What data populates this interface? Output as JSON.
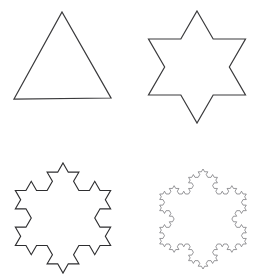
{
  "figure": {
    "background_color": "#ffffff",
    "width": 259,
    "height": 280,
    "layout": "2x2-grid",
    "panels": [
      {
        "name": "stage-0-triangle",
        "label": "Equilateral Triangle",
        "iteration": 0,
        "segment_count": 3,
        "cell": {
          "x": 0,
          "y": 0,
          "width": 130,
          "height": 140
        },
        "center_x": 62,
        "center_y": 70,
        "radius": 51,
        "rotation_deg": -90,
        "stroke_color": "#3a3a3c",
        "stroke_width": 1.25,
        "vertices": [
          {
            "x": 62,
            "y": 12
          },
          {
            "x": 111,
            "y": 98
          },
          {
            "x": 14,
            "y": 99
          }
        ]
      },
      {
        "name": "stage-1-hexagram",
        "label": "Star of David",
        "iteration": 1,
        "segment_count": 12,
        "cell": {
          "x": 130,
          "y": 0,
          "width": 129,
          "height": 140
        },
        "center_x": 197,
        "center_y": 67,
        "radius": 56,
        "rotation_deg": -90,
        "stroke_color": "#3a3a3c",
        "stroke_width": 1.2,
        "extent": {
          "top": 10,
          "bottom": 123,
          "left": 152,
          "right": 243
        }
      },
      {
        "name": "stage-2-snowflake",
        "label": "Koch Snowflake Iteration 2",
        "iteration": 2,
        "segment_count": 48,
        "cell": {
          "x": 0,
          "y": 140,
          "width": 130,
          "height": 140
        },
        "center_x": 63,
        "center_y": 218,
        "radius": 55,
        "rotation_deg": -90,
        "stroke_color": "#2e2e30",
        "stroke_width": 1.15,
        "extent": {
          "top": 163,
          "bottom": 273,
          "left": 11,
          "right": 115
        }
      },
      {
        "name": "stage-3-snowflake",
        "label": "Koch Snowflake Iteration 3",
        "iteration": 3,
        "segment_count": 192,
        "cell": {
          "x": 130,
          "y": 140,
          "width": 129,
          "height": 140
        },
        "center_x": 203,
        "center_y": 219,
        "radius": 50,
        "rotation_deg": -90,
        "stroke_color": "#6b6b70",
        "stroke_width": 0.7,
        "extent": {
          "top": 166,
          "bottom": 272,
          "left": 156,
          "right": 250
        }
      }
    ]
  }
}
